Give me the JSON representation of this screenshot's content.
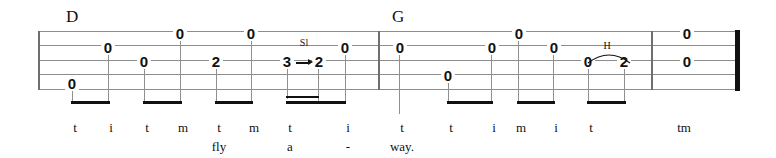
{
  "score": {
    "instrument_staff_lines": 5,
    "measure_count": 3,
    "chords": [
      {
        "label": "D",
        "x": 66,
        "y": 8
      },
      {
        "label": "G",
        "x": 392,
        "y": 8
      }
    ],
    "notes": [
      {
        "fret": "0",
        "string": 5,
        "x": 72,
        "stem": "down",
        "beam_group": 1
      },
      {
        "fret": "0",
        "string": 2,
        "x": 108,
        "stem": "down",
        "beam_group": 1
      },
      {
        "fret": "0",
        "string": 1,
        "x": 180,
        "stem": "down",
        "beam_group": 2
      },
      {
        "fret": "0",
        "string": 3,
        "x": 144,
        "stem": "down",
        "beam_group": 2
      },
      {
        "fret": "0",
        "string": 1,
        "x": 251,
        "stem": "down",
        "beam_group": 3
      },
      {
        "fret": "2",
        "string": 3,
        "x": 216,
        "stem": "down",
        "beam_group": 3
      },
      {
        "fret": "3",
        "string": 3,
        "x": 287,
        "stem": "down",
        "beam_group": 4
      },
      {
        "fret": "2",
        "string": 3,
        "x": 318,
        "stem": "down",
        "beam_group": 4
      },
      {
        "fret": "0",
        "string": 2,
        "x": 345,
        "stem": "down",
        "beam_group": 4
      },
      {
        "fret": "0",
        "string": 2,
        "x": 399,
        "stem": "down",
        "beam_group": 5
      },
      {
        "fret": "0",
        "string": 4,
        "x": 448,
        "stem": "down",
        "beam_group": 6
      },
      {
        "fret": "0",
        "string": 2,
        "x": 491,
        "stem": "down",
        "beam_group": 6
      },
      {
        "fret": "0",
        "string": 1,
        "x": 518,
        "stem": "down",
        "beam_group": 7
      },
      {
        "fret": "0",
        "string": 2,
        "x": 553,
        "stem": "down",
        "beam_group": 7
      },
      {
        "fret": "0",
        "string": 3,
        "x": 588,
        "stem": "down",
        "beam_group": 8
      },
      {
        "fret": "2",
        "string": 3,
        "x": 624,
        "stem": "down",
        "beam_group": 8
      },
      {
        "fret": "0",
        "string": 1,
        "x": 686,
        "stem": "none",
        "beam_group": 0
      },
      {
        "fret": "0",
        "string": 2,
        "x": 686,
        "stem": "none",
        "beam_group": 0
      }
    ],
    "articulations": [
      {
        "type": "slide",
        "label": "Sl",
        "from_fret": "3",
        "to_fret": "2",
        "x": 296,
        "y": 40
      },
      {
        "type": "hammer-on",
        "label": "H",
        "from_fret": "0",
        "to_fret": "2",
        "x": 600,
        "y": 43
      }
    ],
    "fingering_row": [
      {
        "text": "t",
        "x": 63
      },
      {
        "text": "i",
        "x": 99
      },
      {
        "text": "t",
        "x": 135
      },
      {
        "text": "m",
        "x": 171
      },
      {
        "text": "t",
        "x": 207
      },
      {
        "text": "m",
        "x": 242
      },
      {
        "text": "t",
        "x": 278
      },
      {
        "text": "i",
        "x": 336
      },
      {
        "text": "t",
        "x": 390
      },
      {
        "text": "t",
        "x": 439
      },
      {
        "text": "i",
        "x": 482
      },
      {
        "text": "m",
        "x": 509
      },
      {
        "text": "i",
        "x": 544
      },
      {
        "text": "t",
        "x": 579
      },
      {
        "text": "tm",
        "x": 672
      }
    ],
    "lyrics_row": [
      {
        "text": "fly",
        "x": 202
      },
      {
        "text": "a",
        "x": 273
      },
      {
        "text": "-",
        "x": 331
      },
      {
        "text": "way.",
        "x": 385
      }
    ]
  },
  "colors": {
    "staff_line": "#8d8d8d",
    "note_text": "#111111",
    "beam": "#111111",
    "barline": "#6f6f6f",
    "final_barline": "#111111"
  }
}
